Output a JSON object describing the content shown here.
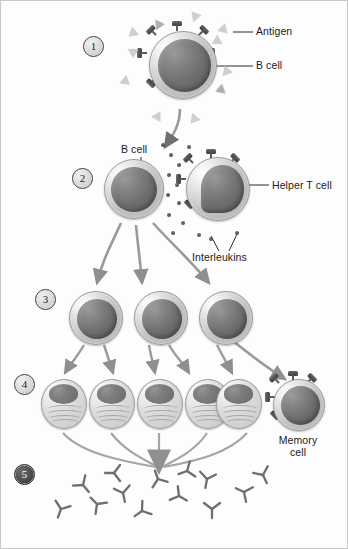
{
  "diagram": {
    "background_color": "#fdfdfd",
    "line_color": "#2b2b2b",
    "arrow_color": "#8f8f8f"
  },
  "steps": [
    {
      "number": "1",
      "x": 82,
      "y": 35
    },
    {
      "number": "2",
      "x": 71,
      "y": 167
    },
    {
      "number": "3",
      "x": 34,
      "y": 288
    },
    {
      "number": "4",
      "x": 13,
      "y": 373
    },
    {
      "number": "5",
      "x": 13,
      "y": 463,
      "dark": true
    }
  ],
  "labels": {
    "antigen": "Antigen",
    "b_cell_step1": "B cell",
    "b_cell_step2": "B cell",
    "helper_t_cell": "Helper T cell",
    "interleukins": "Interleukins",
    "memory_cell_line1": "Memory",
    "memory_cell_line2": "cell"
  },
  "step1": {
    "cell_name": "b-cell",
    "cell": {
      "x": 148,
      "y": 30,
      "size": 66
    },
    "receptor_count": 8,
    "antigen_count": 11
  },
  "step2": {
    "b_cell": {
      "x": 103,
      "y": 158,
      "size": 58
    },
    "helper_t_cell": {
      "x": 185,
      "y": 156,
      "size": 62
    },
    "helper_t_receptor_count": 7,
    "interleukin_count": 14
  },
  "step3": {
    "cell_count": 3,
    "cells": [
      {
        "x": 68,
        "y": 290,
        "size": 52
      },
      {
        "x": 133,
        "y": 290,
        "size": 52
      },
      {
        "x": 198,
        "y": 290,
        "size": 52
      }
    ]
  },
  "step4": {
    "plasma_cell_count": 5,
    "plasma_cells": [
      {
        "x": 40,
        "y": 378,
        "w": 46,
        "h": 50
      },
      {
        "x": 88,
        "y": 378,
        "w": 46,
        "h": 50
      },
      {
        "x": 136,
        "y": 378,
        "w": 46,
        "h": 50
      },
      {
        "x": 184,
        "y": 378,
        "w": 46,
        "h": 50
      },
      {
        "x": 215,
        "y": 378,
        "w": 46,
        "h": 50
      }
    ],
    "memory_cell": {
      "x": 272,
      "y": 378,
      "size": 50,
      "receptor_count": 7
    }
  },
  "step5": {
    "antibody_count": 13,
    "antibody_shape": "Y-shaped",
    "antibodies": [
      {
        "x": 82,
        "y": 484,
        "r": -40
      },
      {
        "x": 60,
        "y": 508,
        "r": 20
      },
      {
        "x": 96,
        "y": 503,
        "r": 135
      },
      {
        "x": 122,
        "y": 492,
        "r": -12
      },
      {
        "x": 141,
        "y": 510,
        "r": 55
      },
      {
        "x": 157,
        "y": 478,
        "r": 160
      },
      {
        "x": 178,
        "y": 495,
        "r": -60
      },
      {
        "x": 206,
        "y": 478,
        "r": 10
      },
      {
        "x": 211,
        "y": 508,
        "r": 0
      },
      {
        "x": 243,
        "y": 491,
        "r": 115
      },
      {
        "x": 262,
        "y": 474,
        "r": -25
      },
      {
        "x": 113,
        "y": 472,
        "r": 90
      },
      {
        "x": 186,
        "y": 470,
        "r": 70
      }
    ]
  }
}
